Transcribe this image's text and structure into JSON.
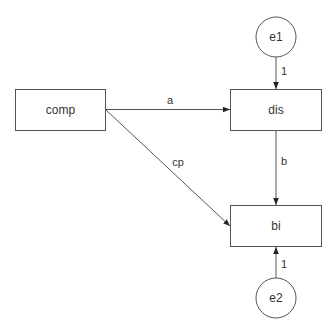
{
  "diagram": {
    "type": "path-diagram",
    "nodes": {
      "comp": {
        "label": "comp",
        "shape": "rect"
      },
      "dis": {
        "label": "dis",
        "shape": "rect"
      },
      "bi": {
        "label": "bi",
        "shape": "rect"
      },
      "e1": {
        "label": "e1",
        "shape": "circle"
      },
      "e2": {
        "label": "e2",
        "shape": "circle"
      }
    },
    "edges": {
      "a": {
        "from": "comp",
        "to": "dis",
        "label": "a"
      },
      "cp": {
        "from": "comp",
        "to": "bi",
        "label": "cp"
      },
      "b": {
        "from": "dis",
        "to": "bi",
        "label": "b"
      },
      "e1_dis": {
        "from": "e1",
        "to": "dis",
        "label": "1"
      },
      "e2_bi": {
        "from": "e2",
        "to": "bi",
        "label": "1"
      }
    },
    "colors": {
      "stroke": "#555555",
      "text": "#333333",
      "background": "#ffffff"
    }
  }
}
